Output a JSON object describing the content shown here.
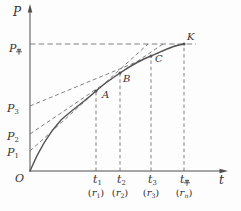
{
  "chart_data": {
    "type": "line",
    "xlabel": "t",
    "ylabel": "P",
    "x_tick_labels": [
      "t1",
      "t2",
      "t3",
      "t平"
    ],
    "x_tick_sublabels": [
      "(r1)",
      "(r2)",
      "(r3)",
      "(rn)"
    ],
    "y_tick_labels": [
      "P1",
      "P2",
      "P3",
      "P平"
    ],
    "curve_point_labels": [
      "O",
      "A",
      "B",
      "C",
      "K"
    ],
    "layout": {
      "grid": false,
      "legend": "none",
      "curve": "concave rising from origin, levelling off at P平 at point K",
      "dashed_tangents": "tangents at A, B, C intercept P axis at P1, P2, P3; horizontal dashed line at P平 through K; vertical dashed lines at t1, t2, t3, t平"
    }
  },
  "diagram": {
    "size": {
      "w": 241,
      "h": 211
    },
    "colors": {
      "axis": "#4f4f4f",
      "curve": "#525252",
      "dash": "#6b6b6b",
      "text": "#333333",
      "bg": "#fdfdfd"
    },
    "axes": [
      {
        "name": "p-axis",
        "x1": 30,
        "y1": 171.5,
        "x2": 30,
        "y2": 11,
        "arrow": "30,4 27.7,12.5 32.3,12.5"
      },
      {
        "name": "t-axis",
        "x1": 29.5,
        "y1": 171,
        "x2": 221,
        "y2": 171,
        "arrow": "228,171 219.5,168.7 219.5,173.3"
      }
    ],
    "curve": {
      "name": "p-t-curve",
      "path": "M 30 171 C 40 147 49 133 61 120 C 72 110 85 101 96 91 C 106 82 111 79 120 73 C 132 65 140 60 151 56 C 163 51 172 45.5 184 44",
      "width": 1.35
    },
    "dashed_lines": [
      {
        "name": "equilibrium-level-line",
        "x1": 30,
        "y1": 44,
        "x2": 196,
        "y2": 44,
        "dash": "5.5 3.2"
      },
      {
        "name": "tangent-at-A",
        "x1": 30,
        "y1": 151,
        "x2": 148,
        "y2": 44,
        "dash": "4 2.8"
      },
      {
        "name": "tangent-at-B",
        "x1": 30,
        "y1": 134,
        "x2": 163,
        "y2": 44,
        "dash": "4 2.8"
      },
      {
        "name": "tangent-at-C",
        "x1": 30,
        "y1": 106,
        "x2": 180,
        "y2": 44,
        "dash": "4 2.8"
      },
      {
        "name": "vline-t1",
        "x1": 96,
        "y1": 171,
        "x2": 96,
        "y2": 91,
        "dash": "3.5 2.8"
      },
      {
        "name": "vline-t2",
        "x1": 120,
        "y1": 171,
        "x2": 120,
        "y2": 73,
        "dash": "3.5 2.8"
      },
      {
        "name": "vline-t3",
        "x1": 151,
        "y1": 171,
        "x2": 151,
        "y2": 56,
        "dash": "3.5 2.8"
      },
      {
        "name": "vline-teq",
        "x1": 184,
        "y1": 171,
        "x2": 184,
        "y2": 44,
        "dash": "3.5 2.8"
      }
    ],
    "points": [
      {
        "name": "point-A",
        "x": 96,
        "y": 91
      },
      {
        "name": "point-B",
        "x": 120,
        "y": 73
      },
      {
        "name": "point-C",
        "x": 151,
        "y": 56
      },
      {
        "name": "point-K",
        "x": 184,
        "y": 44
      }
    ],
    "labels": [
      {
        "name": "p-axis-label",
        "x": 13,
        "y": 16,
        "size": 12,
        "parts": [
          {
            "t": "P",
            "s": "i"
          }
        ]
      },
      {
        "name": "t-axis-label",
        "x": 219,
        "y": 184,
        "size": 12,
        "parts": [
          {
            "t": "t",
            "s": "i"
          }
        ]
      },
      {
        "name": "origin-label",
        "x": 15,
        "y": 182,
        "size": 11,
        "parts": [
          {
            "t": "O",
            "s": "i"
          }
        ]
      },
      {
        "name": "p-equilibrium-label",
        "x": 9,
        "y": 52,
        "size": 11,
        "parts": [
          {
            "t": "P",
            "s": "i"
          },
          {
            "t": "平",
            "s": "ping"
          }
        ]
      },
      {
        "name": "p3-label",
        "x": 7,
        "y": 112,
        "size": 11,
        "parts": [
          {
            "t": "P",
            "s": "i"
          },
          {
            "t": "3",
            "s": "sub"
          }
        ]
      },
      {
        "name": "p2-label",
        "x": 7,
        "y": 140,
        "size": 11,
        "parts": [
          {
            "t": "P",
            "s": "i"
          },
          {
            "t": "2",
            "s": "sub"
          }
        ]
      },
      {
        "name": "p1-label",
        "x": 7,
        "y": 156,
        "size": 11,
        "parts": [
          {
            "t": "P",
            "s": "i"
          },
          {
            "t": "1",
            "s": "sub"
          }
        ]
      },
      {
        "name": "point-label-A",
        "x": 102,
        "y": 98,
        "size": 10,
        "parts": [
          {
            "t": "A",
            "s": "i"
          }
        ]
      },
      {
        "name": "point-label-B",
        "x": 123,
        "y": 82,
        "size": 10,
        "parts": [
          {
            "t": "B",
            "s": "i"
          }
        ]
      },
      {
        "name": "point-label-C",
        "x": 155,
        "y": 62,
        "size": 10,
        "parts": [
          {
            "t": "C",
            "s": "i"
          }
        ]
      },
      {
        "name": "point-label-K",
        "x": 187,
        "y": 40,
        "size": 10,
        "parts": [
          {
            "t": "K",
            "s": "i"
          }
        ]
      },
      {
        "name": "t1-label",
        "x": 93,
        "y": 183,
        "size": 11,
        "parts": [
          {
            "t": "t",
            "s": "i"
          },
          {
            "t": "1",
            "s": "sub"
          }
        ]
      },
      {
        "name": "t2-label",
        "x": 117,
        "y": 183,
        "size": 11,
        "parts": [
          {
            "t": "t",
            "s": "i"
          },
          {
            "t": "2",
            "s": "sub"
          }
        ]
      },
      {
        "name": "t3-label",
        "x": 148,
        "y": 183,
        "size": 11,
        "parts": [
          {
            "t": "t",
            "s": "i"
          },
          {
            "t": "3",
            "s": "sub"
          }
        ]
      },
      {
        "name": "t-equilibrium-label",
        "x": 180,
        "y": 183,
        "size": 11,
        "parts": [
          {
            "t": "t",
            "s": "i"
          },
          {
            "t": "平",
            "s": "ping"
          }
        ]
      },
      {
        "name": "r1-label",
        "x": 96,
        "y": 196,
        "size": 10,
        "anchor": "middle",
        "parts": [
          {
            "t": "(",
            "s": "n"
          },
          {
            "t": "r",
            "s": "i"
          },
          {
            "t": "1",
            "s": "sub"
          },
          {
            "t": ")",
            "s": "n"
          }
        ]
      },
      {
        "name": "r2-label",
        "x": 120,
        "y": 196,
        "size": 10,
        "anchor": "middle",
        "parts": [
          {
            "t": "(",
            "s": "n"
          },
          {
            "t": "r",
            "s": "i"
          },
          {
            "t": "2",
            "s": "sub"
          },
          {
            "t": ")",
            "s": "n"
          }
        ]
      },
      {
        "name": "r3-label",
        "x": 151,
        "y": 196,
        "size": 10,
        "anchor": "middle",
        "parts": [
          {
            "t": "(",
            "s": "n"
          },
          {
            "t": "r",
            "s": "i"
          },
          {
            "t": "3",
            "s": "sub"
          },
          {
            "t": ")",
            "s": "n"
          }
        ]
      },
      {
        "name": "rn-label",
        "x": 184,
        "y": 196,
        "size": 10,
        "anchor": "middle",
        "parts": [
          {
            "t": "(",
            "s": "n"
          },
          {
            "t": "r",
            "s": "i"
          },
          {
            "t": "n",
            "s": "subi"
          },
          {
            "t": ")",
            "s": "n"
          }
        ]
      }
    ]
  }
}
